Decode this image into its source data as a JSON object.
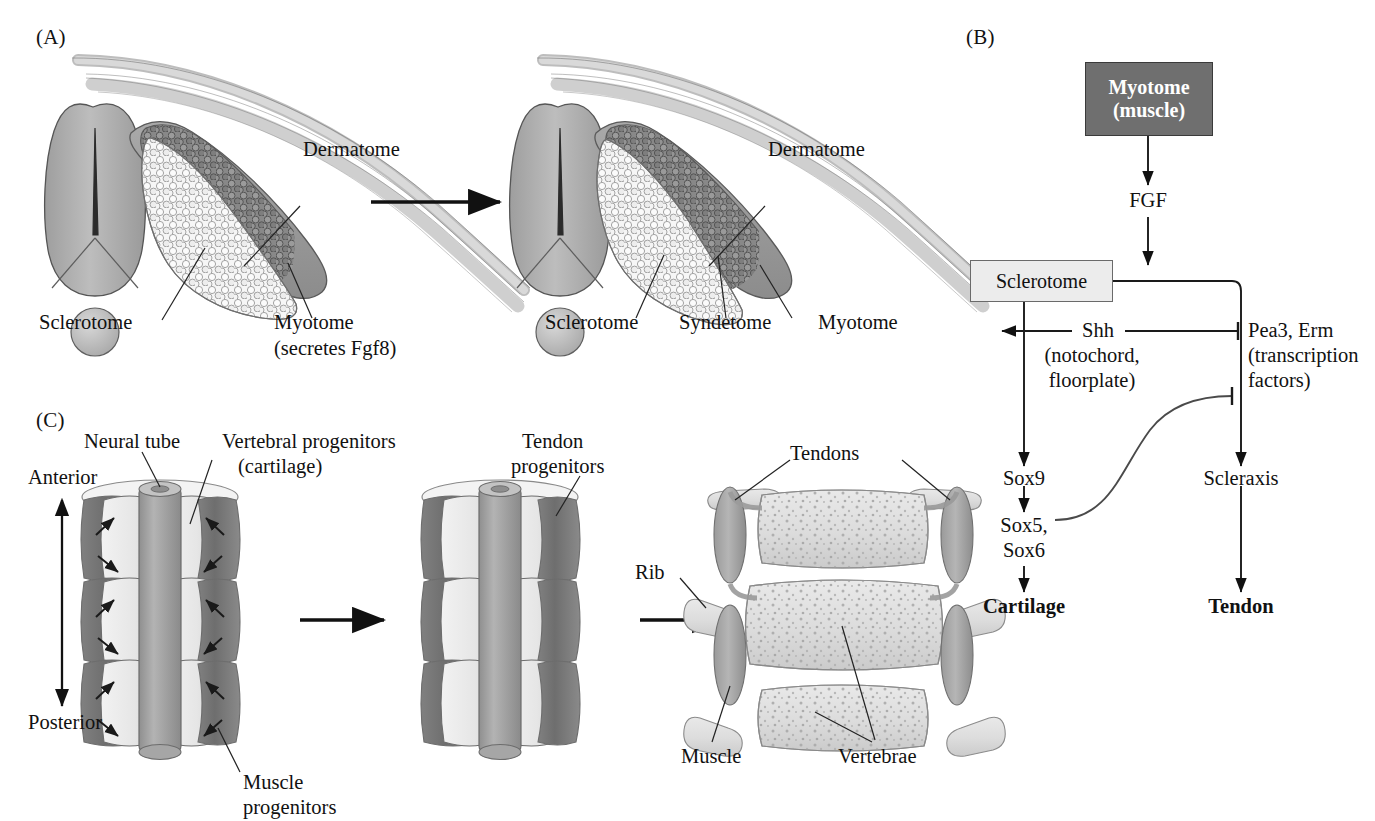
{
  "figure": {
    "panels": [
      {
        "id": "A",
        "letter": "(A)"
      },
      {
        "id": "B",
        "letter": "(B)"
      },
      {
        "id": "C",
        "letter": "(C)"
      }
    ]
  },
  "panel_a": {
    "letter": "(A)",
    "stage_left": {
      "labels": {
        "dermatome": "Dermatome",
        "sclerotome": "Sclerotome",
        "myotome": "Myotome",
        "myotome_sub": "(secretes Fgf8)"
      }
    },
    "stage_right": {
      "labels": {
        "dermatome": "Dermatome",
        "sclerotome": "Sclerotome",
        "syndetome": "Syndetome",
        "myotome": "Myotome"
      }
    },
    "arrow": "transition-arrow"
  },
  "panel_b": {
    "letter": "(B)",
    "nodes": {
      "myotome": {
        "line1": "Myotome",
        "line2": "(muscle)",
        "style": "dark-box"
      },
      "fgf": {
        "label": "FGF"
      },
      "sclerotome": {
        "label": "Sclerotome",
        "style": "light-box"
      },
      "shh": {
        "line1": "Shh",
        "line2": "(notochord,",
        "line3": "floorplate)"
      },
      "pea3": {
        "line1": "Pea3, Erm",
        "line2": "(transcription",
        "line3": "factors)"
      },
      "sox9": {
        "label": "Sox9"
      },
      "sox56": {
        "line1": "Sox5,",
        "line2": "Sox6"
      },
      "scleraxis": {
        "label": "Scleraxis"
      },
      "cartilage": {
        "label": "Cartilage"
      },
      "tendon": {
        "label": "Tendon"
      }
    },
    "colors": {
      "dark_box_fill": "#6f6f6f",
      "dark_box_text": "#ffffff",
      "light_box_fill": "#ececec",
      "line": "#1a1a1a"
    }
  },
  "panel_c": {
    "letter": "(C)",
    "axis": {
      "top": "Anterior",
      "bottom": "Posterior"
    },
    "stage1": {
      "labels": {
        "neural_tube": "Neural tube",
        "vertebral_progenitors_l1": "Vertebral progenitors",
        "vertebral_progenitors_l2": "(cartilage)",
        "muscle_progenitors_l1": "Muscle",
        "muscle_progenitors_l2": "progenitors"
      }
    },
    "stage2": {
      "labels": {
        "tendon_progenitors_l1": "Tendon",
        "tendon_progenitors_l2": "progenitors"
      }
    },
    "stage3": {
      "labels": {
        "tendons": "Tendons",
        "rib": "Rib",
        "muscle": "Muscle",
        "vertebrae": "Vertebrae"
      }
    }
  }
}
